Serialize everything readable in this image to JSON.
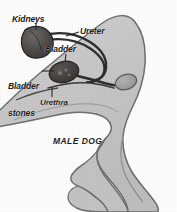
{
  "figure": {
    "caption": "MALE DOG",
    "background_color": "#ffffff",
    "body_fill_color": "#c9c9c9",
    "body_outline_color": "#6b6b6b",
    "organ_fill_color": "#4a4a4a",
    "organ_outline_color": "#2b2b2b",
    "tube_color": "#2e2e2e",
    "label_color": "#1c1c1c",
    "leader_line_color": "#2b2b2b"
  },
  "labels": [
    {
      "id": "kidneys",
      "text": "Kidneys"
    },
    {
      "id": "ureter",
      "text": "Ureter"
    },
    {
      "id": "bladder",
      "text": "Bladder"
    },
    {
      "id": "bladder_stones_line1",
      "text": "Bladder"
    },
    {
      "id": "bladder_stones_line2",
      "text": "stones"
    },
    {
      "id": "urethra",
      "text": "Urethra"
    }
  ],
  "anatomy": {
    "kidneys": "Kidneys",
    "ureter": "Ureter",
    "bladder": "Bladder",
    "bladder_stones": "Bladder stones",
    "urethra": "Urethra",
    "testicle": "Testicle"
  }
}
